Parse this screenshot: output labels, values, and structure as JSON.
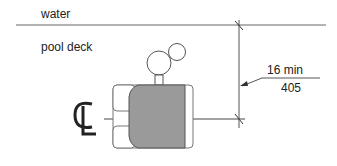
{
  "labels": {
    "water": "water",
    "pool_deck": "pool deck",
    "dimension_imperial": "16 min",
    "dimension_metric": "405",
    "centerline_symbol": "CL"
  },
  "colors": {
    "line": "#555555",
    "seat_fill": "#9a9a9a",
    "text": "#222222",
    "background": "#ffffff"
  }
}
